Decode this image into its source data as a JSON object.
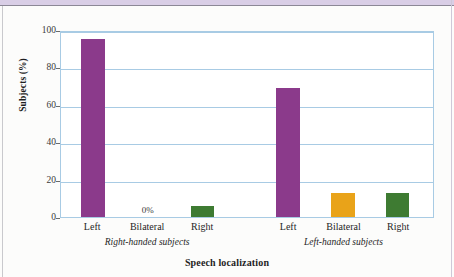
{
  "chart_data": {
    "type": "bar",
    "title": "",
    "xlabel": "Speech localization",
    "ylabel": "Subjects (%)",
    "ylim": [
      0,
      100
    ],
    "yticks": [
      0,
      20,
      40,
      60,
      80,
      100
    ],
    "ytick_labels": [
      "0",
      "20",
      "40",
      "60",
      "80",
      "100"
    ],
    "grid": true,
    "legend": "none",
    "categories": [
      "Left",
      "Bilateral",
      "Right",
      "Left",
      "Bilateral",
      "Right"
    ],
    "groups": [
      {
        "name": "Right-handed subjects",
        "categories": [
          "Left",
          "Bilateral",
          "Right"
        ],
        "values": [
          96,
          0,
          6
        ],
        "colors": [
          "#8B3A8B",
          "#8B3A8B",
          "#3E7B32"
        ]
      },
      {
        "name": "Left-handed subjects",
        "categories": [
          "Left",
          "Bilateral",
          "Right"
        ],
        "values": [
          70,
          13,
          13
        ],
        "colors": [
          "#8B3A8B",
          "#E9A319",
          "#3E7B32"
        ]
      }
    ],
    "bars": [
      {
        "label": "Left",
        "group": "Right-handed subjects",
        "value": 96,
        "color": "#8B3A8B",
        "center_pct": 8.6,
        "value_label": ""
      },
      {
        "label": "Bilateral",
        "group": "Right-handed subjects",
        "value": 0,
        "color": "#8B3A8B",
        "center_pct": 23.3,
        "value_label": "0%"
      },
      {
        "label": "Right",
        "group": "Right-handed subjects",
        "value": 6,
        "color": "#3E7B32",
        "center_pct": 38.0,
        "value_label": ""
      },
      {
        "label": "Left",
        "group": "Left-handed subjects",
        "value": 70,
        "color": "#8B3A8B",
        "center_pct": 61.0,
        "value_label": ""
      },
      {
        "label": "Bilateral",
        "group": "Left-handed subjects",
        "value": 13,
        "color": "#E9A319",
        "center_pct": 75.8,
        "value_label": ""
      },
      {
        "label": "Right",
        "group": "Left-handed subjects",
        "value": 13,
        "color": "#3E7B32",
        "center_pct": 90.4,
        "value_label": ""
      }
    ],
    "group_label_positions_pct": [
      23.3,
      75.8
    ],
    "annotations": [
      "0%"
    ]
  },
  "colors": {
    "purple": "#8B3A8B",
    "green": "#3E7B32",
    "orange": "#E9A319",
    "grid": "#a8cbe4",
    "axis_text": "#1f1f1f",
    "top_band": "#d9cee6"
  }
}
